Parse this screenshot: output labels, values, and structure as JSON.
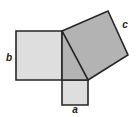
{
  "figure": {
    "name": "pythagorean-theorem-squares-diagram",
    "type": "geometry-diagram",
    "width": 139,
    "height": 117,
    "background_color": "#ffffff",
    "stroke_color": "#262626",
    "stroke_width": 1.6
  },
  "labels": {
    "a": "a",
    "b": "b",
    "c": "c"
  },
  "label_positions": {
    "a": {
      "x": 75,
      "y": 113
    },
    "b": {
      "x": 9,
      "y": 61
    },
    "c": {
      "x": 125,
      "y": 28
    }
  },
  "colors": {
    "square_a_fill": "#dedede",
    "square_b_fill": "#dedede",
    "square_c_fill": "#b3b3b3",
    "triangle_fill": "#b3b3b3",
    "outline": "#262626"
  },
  "shapes": {
    "triangle": {
      "name": "right-triangle",
      "points": "62,31 88,80 62,80"
    },
    "square_b": {
      "name": "square-on-leg-b",
      "points": "16,31 62,31 62,80 16,80"
    },
    "square_a": {
      "name": "square-on-leg-a",
      "points": "62,80 88,80 88,105 62,105"
    },
    "square_c": {
      "name": "square-on-hypotenuse-c",
      "points": "62,31 108,11 128,55 88,80"
    }
  },
  "geometry": {
    "vertices": {
      "triangle_top": {
        "x": 62,
        "y": 31
      },
      "triangle_right": {
        "x": 88,
        "y": 80
      },
      "triangle_corner": {
        "x": 62,
        "y": 80
      }
    },
    "square_c_vertices": {
      "left": {
        "x": 62,
        "y": 31
      },
      "top": {
        "x": 108,
        "y": 11
      },
      "right": {
        "x": 128,
        "y": 55
      },
      "bottom": {
        "x": 88,
        "y": 80
      }
    }
  }
}
